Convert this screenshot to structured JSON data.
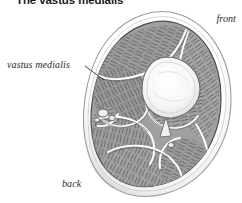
{
  "figure": {
    "title": "The vastus medialis",
    "orientation_labels": {
      "front": "front",
      "back": "back"
    },
    "callouts": [
      {
        "label": "vastus medialis",
        "leader": "line from label to muscle at left of section"
      }
    ],
    "colors": {
      "background": "#ffffff",
      "title_text": "#1a1a1a",
      "annotation_text": "#2b2b2b",
      "skin_outline": "#8a8a8a",
      "fascia": "#cfcfcf",
      "muscle_fill": "#9a9a9a",
      "muscle_fill_light": "#b4b4b4",
      "muscle_fill_dark": "#858585",
      "bone_fill": "#f2f2f2",
      "bone_outline": "#6f6f6f",
      "septum_line": "#ffffff",
      "fiber_stroke": "#4f4f4f"
    },
    "anatomy": {
      "bone": "femur",
      "bone_position": "center-upper",
      "compartments": [
        "vastus medialis",
        "vastus lateralis",
        "vastus intermedius",
        "rectus femoris",
        "adductor group",
        "hamstring group",
        "sartorius"
      ],
      "neurovascular_bundle": "medial, below vastus medialis"
    }
  }
}
